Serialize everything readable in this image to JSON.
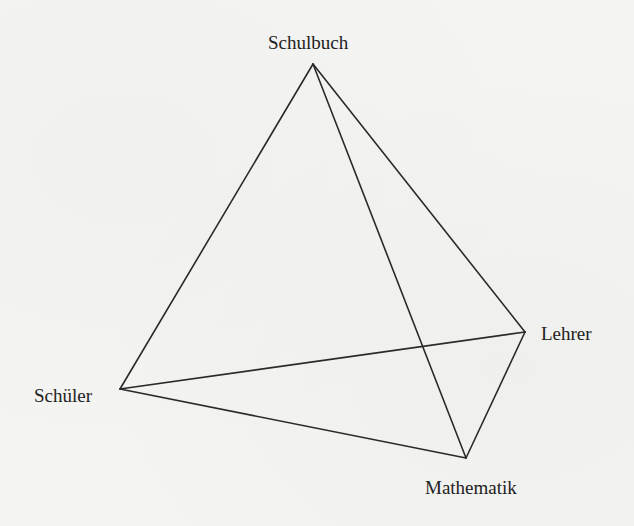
{
  "diagram": {
    "type": "tetrahedron",
    "title": "",
    "colors": {
      "background": "#f4f4f2",
      "line": "#2a2a2a",
      "text": "#222222"
    },
    "vertices": [
      {
        "id": "schulbuch",
        "label": "Schulbuch",
        "x": 313,
        "y": 64
      },
      {
        "id": "schueler",
        "label": "Schüler",
        "x": 120,
        "y": 389
      },
      {
        "id": "lehrer",
        "label": "Lehrer",
        "x": 525,
        "y": 332
      },
      {
        "id": "mathematik",
        "label": "Mathematik",
        "x": 466,
        "y": 458
      }
    ],
    "edges": [
      {
        "from": "schulbuch",
        "to": "schueler"
      },
      {
        "from": "schulbuch",
        "to": "lehrer"
      },
      {
        "from": "schulbuch",
        "to": "mathematik"
      },
      {
        "from": "schueler",
        "to": "lehrer"
      },
      {
        "from": "schueler",
        "to": "mathematik"
      },
      {
        "from": "lehrer",
        "to": "mathematik"
      }
    ]
  },
  "labels": {
    "schulbuch": "Schulbuch",
    "schueler": "Schüler",
    "lehrer": "Lehrer",
    "mathematik": "Mathematik"
  }
}
